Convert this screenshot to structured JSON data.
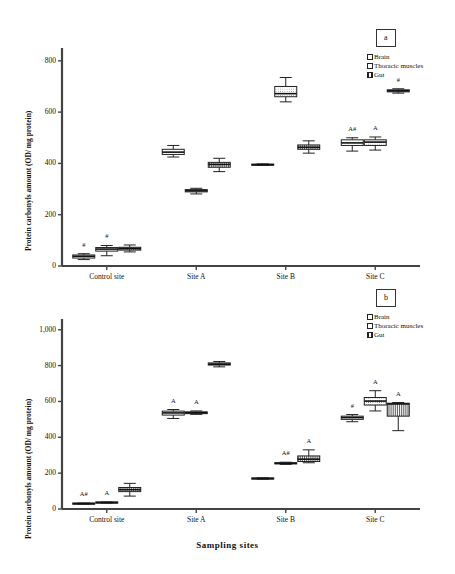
{
  "figure": {
    "panels": [
      {
        "tag": "a",
        "ylabel": "Protein carbonyls amount (OD/ mg protein)",
        "xlabel": "",
        "legend": [
          {
            "label": "Brain",
            "fill": "white"
          },
          {
            "label": "Thoracic muscles",
            "fill": "dots"
          },
          {
            "label": "Gut",
            "fill": "hatch"
          }
        ]
      },
      {
        "tag": "b",
        "ylabel": "Protein carbonyls amount (OD/ mg protein)",
        "xlabel": "Sampling sites",
        "legend": [
          {
            "label": "Brain",
            "fill": "white"
          },
          {
            "label": "Thoracic muscles",
            "fill": "dots"
          },
          {
            "label": "Gut",
            "fill": "hatch"
          }
        ]
      }
    ]
  },
  "chart_data": [
    {
      "type": "box",
      "panel": "a",
      "title": "",
      "xlabel": "",
      "ylabel": "Protein carbonyls amount (OD/ mg protein)",
      "categories": [
        "Control site",
        "Site A",
        "Site B",
        "Site C"
      ],
      "ylim": [
        0,
        850
      ],
      "yticks": [
        0,
        200,
        400,
        600,
        800
      ],
      "ytick_labels": [
        "0",
        "200",
        "400",
        "600",
        "800"
      ],
      "grid": false,
      "legend_position": "top-right",
      "series": [
        {
          "name": "Brain",
          "fill": "white",
          "boxes": [
            {
              "category": "Control site",
              "min": 25,
              "q1": 31,
              "median": 38,
              "q3": 43,
              "max": 48,
              "annotation": "#"
            },
            {
              "category": "Site A",
              "min": 425,
              "q1": 435,
              "median": 444,
              "q3": 455,
              "max": 470,
              "annotation": ""
            },
            {
              "category": "Site B",
              "min": 392,
              "q1": 393,
              "median": 395,
              "q3": 397,
              "max": 398,
              "annotation": ""
            },
            {
              "category": "Site C",
              "min": 448,
              "q1": 470,
              "median": 480,
              "q3": 492,
              "max": 500,
              "annotation": "A#"
            }
          ]
        },
        {
          "name": "Thoracic muscles",
          "fill": "dots",
          "boxes": [
            {
              "category": "Control site",
              "min": 40,
              "q1": 58,
              "median": 66,
              "q3": 72,
              "max": 80,
              "annotation": "#"
            },
            {
              "category": "Site A",
              "min": 281,
              "q1": 289,
              "median": 293,
              "q3": 298,
              "max": 303,
              "annotation": ""
            },
            {
              "category": "Site B",
              "min": 640,
              "q1": 660,
              "median": 672,
              "q3": 700,
              "max": 735,
              "annotation": ""
            },
            {
              "category": "Site C",
              "min": 452,
              "q1": 470,
              "median": 483,
              "q3": 492,
              "max": 503,
              "annotation": "A"
            }
          ]
        },
        {
          "name": "Gut",
          "fill": "hatch",
          "boxes": [
            {
              "category": "Control site",
              "min": 55,
              "q1": 62,
              "median": 68,
              "q3": 73,
              "max": 82,
              "annotation": ""
            },
            {
              "category": "Site A",
              "min": 368,
              "q1": 385,
              "median": 396,
              "q3": 404,
              "max": 420,
              "annotation": ""
            },
            {
              "category": "Site B",
              "min": 440,
              "q1": 455,
              "median": 463,
              "q3": 472,
              "max": 488,
              "annotation": ""
            },
            {
              "category": "Site C",
              "min": 674,
              "q1": 679,
              "median": 683,
              "q3": 687,
              "max": 691,
              "annotation": "#"
            }
          ]
        }
      ]
    },
    {
      "type": "box",
      "panel": "b",
      "title": "",
      "xlabel": "Sampling sites",
      "ylabel": "Protein carbonyls amount (OD/ mg protein)",
      "categories": [
        "Control site",
        "Site A",
        "Site B",
        "Site C"
      ],
      "ylim": [
        0,
        1060
      ],
      "yticks": [
        0,
        200,
        400,
        600,
        800,
        1000
      ],
      "ytick_labels": [
        "0",
        "200",
        "400",
        "600",
        "800",
        "1,000"
      ],
      "grid": false,
      "legend_position": "top-right",
      "series": [
        {
          "name": "Brain",
          "fill": "white",
          "boxes": [
            {
              "category": "Control site",
              "min": 27,
              "q1": 28,
              "median": 30,
              "q3": 31,
              "max": 33,
              "annotation": "A#"
            },
            {
              "category": "Site A",
              "min": 505,
              "q1": 524,
              "median": 536,
              "q3": 546,
              "max": 555,
              "annotation": "A"
            },
            {
              "category": "Site B",
              "min": 166,
              "q1": 168,
              "median": 170,
              "q3": 172,
              "max": 174,
              "annotation": ""
            },
            {
              "category": "Site C",
              "min": 487,
              "q1": 500,
              "median": 510,
              "q3": 518,
              "max": 527,
              "annotation": "#"
            }
          ]
        },
        {
          "name": "Thoracic muscles",
          "fill": "dots",
          "boxes": [
            {
              "category": "Control site",
              "min": 33,
              "q1": 34,
              "median": 36,
              "q3": 37,
              "max": 39,
              "annotation": "A"
            },
            {
              "category": "Site A",
              "min": 528,
              "q1": 532,
              "median": 537,
              "q3": 542,
              "max": 547,
              "annotation": "A"
            },
            {
              "category": "Site B",
              "min": 249,
              "q1": 252,
              "median": 255,
              "q3": 258,
              "max": 261,
              "annotation": "A#"
            },
            {
              "category": "Site C",
              "min": 547,
              "q1": 580,
              "median": 602,
              "q3": 622,
              "max": 660,
              "annotation": "A"
            }
          ]
        },
        {
          "name": "Gut",
          "fill": "hatch",
          "boxes": [
            {
              "category": "Control site",
              "min": 72,
              "q1": 97,
              "median": 108,
              "q3": 120,
              "max": 143,
              "annotation": ""
            },
            {
              "category": "Site A",
              "min": 793,
              "q1": 803,
              "median": 808,
              "q3": 815,
              "max": 823,
              "annotation": ""
            },
            {
              "category": "Site B",
              "min": 258,
              "q1": 265,
              "median": 278,
              "q3": 296,
              "max": 330,
              "annotation": "A"
            },
            {
              "category": "Site C",
              "min": 437,
              "q1": 518,
              "median": 586,
              "q3": 590,
              "max": 594,
              "annotation": "A"
            }
          ]
        }
      ]
    }
  ]
}
